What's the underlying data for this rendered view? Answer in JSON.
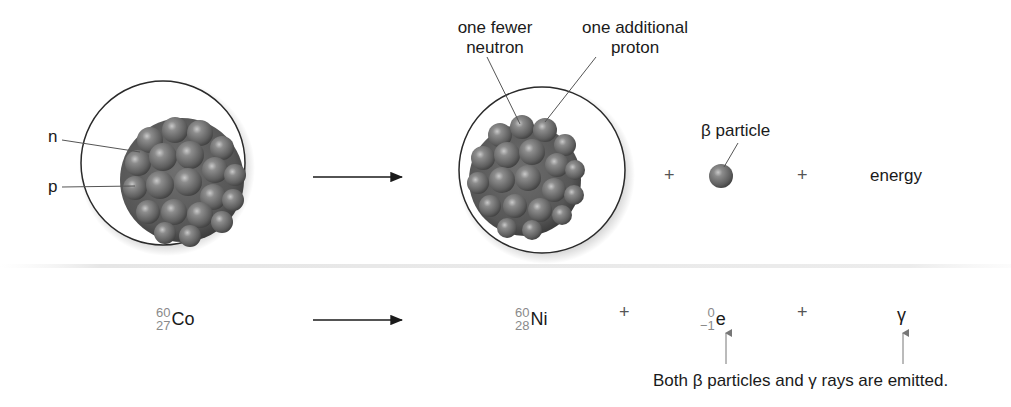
{
  "top_row": {
    "reactant_atom": {
      "labels": {
        "neutron": "n",
        "proton": "p"
      }
    },
    "arrow": "reaction-arrow",
    "product_atom": {
      "annotations": {
        "fewer_neutron_line1": "one fewer",
        "fewer_neutron_line2": "neutron",
        "additional_proton_line1": "one additional",
        "additional_proton_line2": "proton"
      }
    },
    "plus_1": "+",
    "beta_particle_label": "β particle",
    "plus_2": "+",
    "energy_label": "energy"
  },
  "equation": {
    "reactant": {
      "mass": "60",
      "atomic": "27",
      "symbol": "Co"
    },
    "product": {
      "mass": "60",
      "atomic": "28",
      "symbol": "Ni"
    },
    "plus_1": "+",
    "electron": {
      "mass": "0",
      "atomic": "−1",
      "symbol": "e"
    },
    "plus_2": "+",
    "gamma": "γ"
  },
  "caption": "Both β particles and γ rays are emitted.",
  "colors": {
    "nucleon": "#6a6a6a",
    "nucleon_highlight": "#b5b5b5",
    "atom_outline": "#2a2a2a",
    "leader_line": "#555555",
    "isotope_numbers": "#8a8a8a",
    "text": "#1a1a1a"
  }
}
